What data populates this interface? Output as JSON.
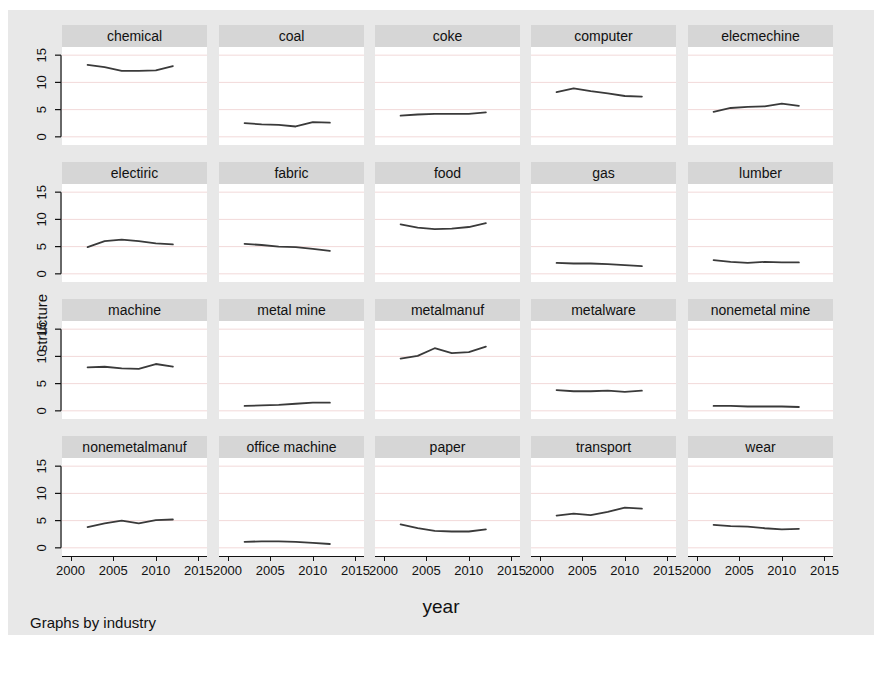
{
  "figure": {
    "ylabel": "structure",
    "xlabel": "year",
    "byline": "Graphs by industry",
    "bg_color": "#e8e8e8",
    "panel_header_color": "#d6d6d6",
    "plot_bg_color": "#ffffff",
    "line_color": "#3a3a3a",
    "grid_color": "#f2d9d9"
  },
  "chart_data": {
    "type": "line",
    "title": "",
    "xlabel": "year",
    "ylabel": "structure",
    "xlim": [
      1999,
      2016
    ],
    "ylim": [
      -1.5,
      16.5
    ],
    "xticks": [
      2000,
      2005,
      2010,
      2015
    ],
    "yticks": [
      0,
      5,
      10,
      15
    ],
    "grid": true,
    "legend": "none",
    "facet_by": "industry",
    "facet_note": "Graphs by industry",
    "x": [
      2002,
      2004,
      2006,
      2008,
      2010,
      2012
    ],
    "panels": [
      {
        "name": "chemical",
        "values": [
          13.2,
          12.8,
          12.1,
          12.1,
          12.2,
          13.0
        ]
      },
      {
        "name": "coal",
        "values": [
          2.5,
          2.3,
          2.2,
          1.9,
          2.7,
          2.6
        ]
      },
      {
        "name": "coke",
        "values": [
          3.9,
          4.1,
          4.2,
          4.2,
          4.2,
          4.5
        ]
      },
      {
        "name": "computer",
        "values": [
          8.2,
          8.9,
          8.4,
          8.0,
          7.5,
          7.4
        ]
      },
      {
        "name": "elecmechine",
        "values": [
          4.6,
          5.3,
          5.5,
          5.6,
          6.1,
          5.7
        ]
      },
      {
        "name": "electiric",
        "values": [
          4.9,
          6.0,
          6.3,
          6.0,
          5.6,
          5.4
        ]
      },
      {
        "name": "fabric",
        "values": [
          5.5,
          5.3,
          5.0,
          4.9,
          4.6,
          4.2
        ]
      },
      {
        "name": "food",
        "values": [
          9.1,
          8.5,
          8.2,
          8.3,
          8.6,
          9.3
        ]
      },
      {
        "name": "gas",
        "values": [
          2.0,
          1.9,
          1.9,
          1.8,
          1.6,
          1.4
        ]
      },
      {
        "name": "lumber",
        "values": [
          2.5,
          2.2,
          2.0,
          2.2,
          2.1,
          2.1
        ]
      },
      {
        "name": "machine",
        "values": [
          8.0,
          8.1,
          7.8,
          7.7,
          8.6,
          8.1
        ]
      },
      {
        "name": "metal mine",
        "values": [
          0.9,
          1.0,
          1.1,
          1.3,
          1.5,
          1.5
        ]
      },
      {
        "name": "metalmanuf",
        "values": [
          9.6,
          10.1,
          11.5,
          10.6,
          10.8,
          11.8
        ]
      },
      {
        "name": "metalware",
        "values": [
          3.8,
          3.6,
          3.6,
          3.7,
          3.5,
          3.7
        ]
      },
      {
        "name": "nonemetal mine",
        "values": [
          0.9,
          0.9,
          0.8,
          0.8,
          0.8,
          0.7
        ]
      },
      {
        "name": "nonemetalmanuf",
        "values": [
          3.8,
          4.5,
          5.0,
          4.5,
          5.1,
          5.2
        ]
      },
      {
        "name": "office machine",
        "values": [
          1.1,
          1.2,
          1.2,
          1.1,
          0.9,
          0.7
        ]
      },
      {
        "name": "paper",
        "values": [
          4.3,
          3.6,
          3.1,
          3.0,
          3.0,
          3.4
        ]
      },
      {
        "name": "transport",
        "values": [
          5.9,
          6.3,
          6.0,
          6.6,
          7.4,
          7.2
        ]
      },
      {
        "name": "wear",
        "values": [
          4.2,
          4.0,
          3.9,
          3.6,
          3.4,
          3.5
        ]
      }
    ]
  },
  "axes": {
    "ytick_labels": [
      "15",
      "10",
      "5",
      "0"
    ],
    "xtick_labels": [
      "2000",
      "2005",
      "2010",
      "2015"
    ]
  }
}
